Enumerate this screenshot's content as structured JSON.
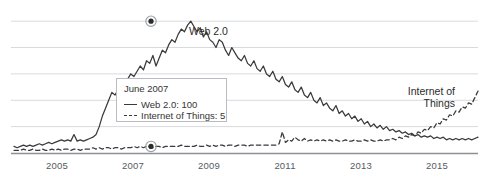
{
  "chart_data": {
    "type": "line",
    "title": "",
    "xlabel": "",
    "ylabel": "",
    "grid": true,
    "gridlines_y": [
      20,
      40,
      60,
      80,
      100
    ],
    "xlim": [
      "2004-01",
      "2016-01"
    ],
    "ylim": [
      0,
      110
    ],
    "tick_labels": [
      "2005",
      "2007",
      "2009",
      "2011",
      "2013",
      "2015"
    ],
    "tick_positions": [
      57,
      133,
      209,
      285,
      361,
      437
    ],
    "annotations": [
      {
        "name": "web-2-0-label",
        "text": "Web 2.0"
      },
      {
        "name": "internet-of-things-label",
        "line1": "Internet of",
        "line2": "Things"
      }
    ],
    "markers": [
      {
        "series": "Web 2.0",
        "date": "June 2007",
        "value": 100
      },
      {
        "series": "Internet of Things",
        "date": "June 2007",
        "value": 5
      }
    ],
    "series": [
      {
        "name": "Web 2.0",
        "style": "solid",
        "color": "#3a3a3a",
        "values": [
          5,
          4,
          5,
          6,
          5,
          6,
          5,
          6,
          7,
          6,
          7,
          8,
          7,
          8,
          9,
          10,
          9,
          10,
          9,
          14,
          9,
          10,
          9,
          10,
          11,
          12,
          14,
          20,
          28,
          34,
          40,
          46,
          44,
          48,
          52,
          50,
          56,
          60,
          58,
          62,
          66,
          63,
          70,
          68,
          74,
          66,
          72,
          78,
          76,
          82,
          86,
          84,
          90,
          94,
          92,
          97,
          100,
          96,
          92,
          95,
          88,
          92,
          86,
          84,
          80,
          86,
          84,
          78,
          74,
          80,
          76,
          72,
          70,
          74,
          68,
          66,
          70,
          64,
          62,
          66,
          60,
          58,
          62,
          56,
          54,
          58,
          52,
          50,
          54,
          48,
          46,
          50,
          44,
          42,
          46,
          40,
          38,
          42,
          36,
          38,
          34,
          32,
          36,
          30,
          32,
          28,
          30,
          26,
          28,
          24,
          26,
          22,
          24,
          20,
          22,
          19,
          21,
          18,
          20,
          17,
          18,
          16,
          17,
          15,
          16,
          14,
          15,
          13,
          14,
          12,
          13,
          12,
          13,
          11,
          12,
          11,
          12,
          10,
          11,
          10,
          11,
          10,
          11,
          10,
          11,
          10,
          11,
          12
        ]
      },
      {
        "name": "Internet of Things",
        "style": "dashed",
        "color": "#3a3a3a",
        "values": [
          2,
          2,
          2,
          3,
          2,
          2,
          3,
          2,
          2,
          3,
          2,
          2,
          3,
          2,
          3,
          2,
          3,
          3,
          2,
          3,
          3,
          2,
          3,
          3,
          3,
          4,
          3,
          4,
          3,
          4,
          4,
          3,
          4,
          4,
          3,
          4,
          4,
          4,
          5,
          4,
          5,
          4,
          5,
          5,
          4,
          5,
          5,
          4,
          5,
          5,
          5,
          5,
          5,
          6,
          5,
          5,
          5,
          5,
          6,
          5,
          5,
          6,
          5,
          6,
          5,
          6,
          6,
          5,
          6,
          6,
          5,
          6,
          6,
          6,
          5,
          6,
          6,
          6,
          6,
          6,
          6,
          6,
          6,
          6,
          7,
          16,
          8,
          10,
          9,
          12,
          10,
          9,
          11,
          9,
          10,
          9,
          10,
          9,
          10,
          9,
          10,
          9,
          10,
          9,
          9,
          10,
          9,
          9,
          10,
          9,
          9,
          10,
          9,
          10,
          9,
          9,
          10,
          9,
          10,
          10,
          11,
          10,
          12,
          11,
          13,
          12,
          14,
          13,
          16,
          15,
          18,
          17,
          20,
          19,
          23,
          22,
          26,
          25,
          29,
          28,
          32,
          31,
          35,
          34,
          38,
          37,
          42,
          47
        ]
      }
    ]
  },
  "tooltip": {
    "date": "June 2007",
    "rows": [
      {
        "label": "Web 2.0: 100",
        "style": "solid"
      },
      {
        "label": "Internet of Things: 5",
        "style": "dashed"
      }
    ]
  },
  "colors": {
    "line": "#3a3a3a",
    "grid": "#d8dade",
    "axis": "#8d9094",
    "tooltip_border": "#b9bcc0",
    "tick_text": "#555b60"
  }
}
